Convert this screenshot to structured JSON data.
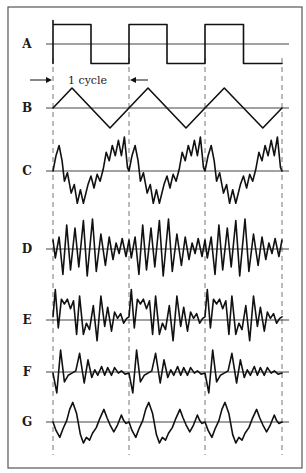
{
  "figure": {
    "frame": {
      "x": 8,
      "y": 7,
      "width": 294,
      "height": 461
    },
    "baseline_x_start": 46,
    "baseline_x_end": 289,
    "cycle_boundaries_x": [
      53,
      129,
      205,
      282
    ],
    "dashed_y_start": 58,
    "dashed_y_end": 455,
    "cycle_annotation": {
      "text": "1 cycle",
      "y": 80,
      "left_arrow_from_x": 30,
      "left_arrow_to_x": 52,
      "right_arrow_from_x": 148,
      "right_arrow_to_x": 130,
      "text_x": 68
    },
    "label_x": 27,
    "colors": {
      "line": "#111111",
      "frame": "#555555",
      "background": "#ffffff"
    }
  },
  "waveforms": [
    {
      "id": "A",
      "label": "A",
      "type": "square",
      "baseline_y": 44,
      "amplitude": 19.5,
      "points_per_cycle": [
        [
          0,
          -1
        ],
        [
          0,
          1
        ],
        [
          0.5,
          1
        ],
        [
          0.5,
          -1
        ],
        [
          1,
          -1
        ]
      ],
      "note": "starts at bottom-left with vertical edge rising from baseline",
      "start_vertical_from": 0
    },
    {
      "id": "B",
      "label": "B",
      "type": "triangle",
      "baseline_y": 108,
      "amplitude": 20,
      "points_per_cycle": [
        [
          0,
          0
        ],
        [
          0.25,
          1
        ],
        [
          0.75,
          -1
        ],
        [
          1,
          0
        ]
      ]
    },
    {
      "id": "C",
      "label": "C",
      "type": "harmonic-rich",
      "baseline_y": 171,
      "amplitude": 34,
      "points_per_cycle": [
        [
          0,
          0
        ],
        [
          0.04,
          0.45
        ],
        [
          0.08,
          0.75
        ],
        [
          0.12,
          0.3
        ],
        [
          0.15,
          -0.3
        ],
        [
          0.19,
          -0.05
        ],
        [
          0.24,
          -0.65
        ],
        [
          0.28,
          -0.4
        ],
        [
          0.32,
          -0.95
        ],
        [
          0.36,
          -0.55
        ],
        [
          0.4,
          -0.95
        ],
        [
          0.46,
          -0.4
        ],
        [
          0.5,
          -0.15
        ],
        [
          0.54,
          -0.5
        ],
        [
          0.58,
          -0.1
        ],
        [
          0.62,
          -0.3
        ],
        [
          0.66,
          0.05
        ],
        [
          0.7,
          0.55
        ],
        [
          0.74,
          0.3
        ],
        [
          0.78,
          0.75
        ],
        [
          0.82,
          0.45
        ],
        [
          0.86,
          0.9
        ],
        [
          0.9,
          0.45
        ],
        [
          0.94,
          1
        ],
        [
          0.98,
          0.1
        ],
        [
          1,
          0
        ]
      ]
    },
    {
      "id": "D",
      "label": "D",
      "type": "high-frequency",
      "baseline_y": 249,
      "amplitude": 30,
      "points_per_cycle": [
        [
          0,
          0.3
        ],
        [
          0.03,
          -0.3
        ],
        [
          0.08,
          0.4
        ],
        [
          0.13,
          -0.85
        ],
        [
          0.18,
          0.8
        ],
        [
          0.23,
          -0.7
        ],
        [
          0.29,
          0.7
        ],
        [
          0.34,
          -0.6
        ],
        [
          0.4,
          0.95
        ],
        [
          0.45,
          -0.9
        ],
        [
          0.52,
          1
        ],
        [
          0.57,
          -0.75
        ],
        [
          0.63,
          0.5
        ],
        [
          0.69,
          -0.55
        ],
        [
          0.74,
          0.4
        ],
        [
          0.79,
          -0.35
        ],
        [
          0.83,
          0.2
        ],
        [
          0.87,
          -0.15
        ],
        [
          0.91,
          0.35
        ],
        [
          0.96,
          -0.25
        ],
        [
          1,
          0.3
        ]
      ]
    },
    {
      "id": "E",
      "label": "E",
      "type": "noisy-harmonic",
      "baseline_y": 320,
      "amplitude": 32,
      "points_per_cycle": [
        [
          0,
          0.1
        ],
        [
          0.03,
          0.95
        ],
        [
          0.07,
          -0.25
        ],
        [
          0.11,
          0.65
        ],
        [
          0.15,
          0.5
        ],
        [
          0.19,
          0.65
        ],
        [
          0.23,
          0.35
        ],
        [
          0.27,
          0.6
        ],
        [
          0.31,
          -0.45
        ],
        [
          0.35,
          0.75
        ],
        [
          0.4,
          -0.45
        ],
        [
          0.44,
          -0.1
        ],
        [
          0.48,
          -0.3
        ],
        [
          0.53,
          0.45
        ],
        [
          0.58,
          -0.65
        ],
        [
          0.63,
          0.75
        ],
        [
          0.68,
          -0.2
        ],
        [
          0.72,
          0.4
        ],
        [
          0.77,
          -0.35
        ],
        [
          0.81,
          0.25
        ],
        [
          0.85,
          0.05
        ],
        [
          0.89,
          0.2
        ],
        [
          0.93,
          -0.1
        ],
        [
          0.97,
          0.05
        ],
        [
          1,
          0.1
        ]
      ]
    },
    {
      "id": "F",
      "label": "F",
      "type": "decaying-impulse",
      "baseline_y": 372,
      "amplitude": 22,
      "points_per_cycle": [
        [
          0,
          -0.05
        ],
        [
          0.05,
          -0.95
        ],
        [
          0.1,
          1
        ],
        [
          0.15,
          -0.45
        ],
        [
          0.2,
          -0.15
        ],
        [
          0.25,
          -0.05
        ],
        [
          0.3,
          0.05
        ],
        [
          0.35,
          0.85
        ],
        [
          0.41,
          -0.5
        ],
        [
          0.46,
          0.55
        ],
        [
          0.51,
          -0.25
        ],
        [
          0.55,
          0.1
        ],
        [
          0.59,
          -0.15
        ],
        [
          0.64,
          0.25
        ],
        [
          0.68,
          -0.15
        ],
        [
          0.72,
          0.2
        ],
        [
          0.77,
          -0.15
        ],
        [
          0.81,
          0.2
        ],
        [
          0.86,
          -0.05
        ],
        [
          0.9,
          0.05
        ],
        [
          0.95,
          -0.1
        ],
        [
          1,
          -0.05
        ]
      ]
    },
    {
      "id": "G",
      "label": "G",
      "type": "low-harmonic",
      "baseline_y": 422,
      "amplitude": 28,
      "points_per_cycle": [
        [
          0,
          0
        ],
        [
          0.04,
          -0.3
        ],
        [
          0.09,
          -0.55
        ],
        [
          0.13,
          -0.25
        ],
        [
          0.18,
          0.05
        ],
        [
          0.22,
          0.45
        ],
        [
          0.26,
          0.7
        ],
        [
          0.31,
          0.3
        ],
        [
          0.36,
          -0.45
        ],
        [
          0.4,
          -0.75
        ],
        [
          0.44,
          -0.55
        ],
        [
          0.48,
          -0.65
        ],
        [
          0.52,
          -0.4
        ],
        [
          0.57,
          -0.2
        ],
        [
          0.62,
          0.15
        ],
        [
          0.67,
          0.45
        ],
        [
          0.71,
          0.15
        ],
        [
          0.75,
          -0.1
        ],
        [
          0.8,
          -0.35
        ],
        [
          0.85,
          -0.1
        ],
        [
          0.9,
          0.25
        ],
        [
          0.93,
          0.05
        ],
        [
          0.96,
          -0.05
        ],
        [
          1,
          0
        ]
      ]
    }
  ]
}
